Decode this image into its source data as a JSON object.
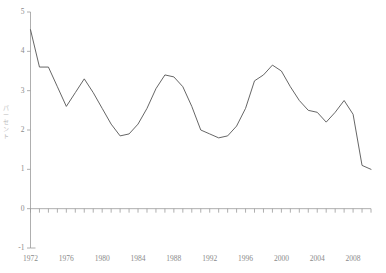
{
  "figure": {
    "top_note": "",
    "background": "#ffffff",
    "line_color": "#555555",
    "axis_color": "#9a9a9a",
    "label_color": "#8a8a8a"
  },
  "axis_labels": {
    "y_vertical_chars": [
      "パ",
      "ー",
      "セ",
      "ン",
      "ト"
    ]
  },
  "chart_data": {
    "type": "line",
    "title": "",
    "subtitle": "",
    "xlabel": "",
    "ylabel": "パーセント",
    "xlim": [
      1972,
      2010
    ],
    "ylim": [
      -1,
      5
    ],
    "grid": false,
    "legend": null,
    "x_tick_labels": [
      "1972",
      "1976",
      "1980",
      "1984",
      "1988",
      "1992",
      "1996",
      "2000",
      "2004",
      "2008"
    ],
    "x_tick_values": [
      1972,
      1976,
      1980,
      1984,
      1988,
      1992,
      1996,
      2000,
      2004,
      2008
    ],
    "x_minor_ticks_every": 1,
    "y_tick_labels": [
      "5",
      "4",
      "3",
      "2",
      "1",
      "0",
      "-1"
    ],
    "y_tick_values": [
      5,
      4,
      3,
      2,
      1,
      0,
      -1
    ],
    "x": [
      1972,
      1973,
      1974,
      1975,
      1976,
      1977,
      1978,
      1979,
      1980,
      1981,
      1982,
      1983,
      1984,
      1985,
      1986,
      1987,
      1988,
      1989,
      1990,
      1991,
      1992,
      1993,
      1994,
      1995,
      1996,
      1997,
      1998,
      1999,
      2000,
      2001,
      2002,
      2003,
      2004,
      2005,
      2006,
      2007,
      2008,
      2009,
      2010
    ],
    "series": [
      {
        "name": "パーセント",
        "color": "#555555",
        "values": [
          4.55,
          3.6,
          3.6,
          3.1,
          2.6,
          2.95,
          3.3,
          2.95,
          2.55,
          2.15,
          1.85,
          1.9,
          2.15,
          2.55,
          3.05,
          3.4,
          3.35,
          3.1,
          2.6,
          2.0,
          1.9,
          1.8,
          1.85,
          2.1,
          2.55,
          3.25,
          3.4,
          3.65,
          3.5,
          3.1,
          2.75,
          2.5,
          2.45,
          2.2,
          2.45,
          2.75,
          2.4,
          1.1,
          1.0
        ]
      }
    ],
    "annotations": [
      {
        "label": "start",
        "x": 1972,
        "y": 4.55
      },
      {
        "label": "plateau",
        "x": 1973,
        "y": 3.6
      },
      {
        "label": "trough",
        "x": 1976,
        "y": 2.6
      },
      {
        "label": "peak",
        "x": 1978,
        "y": 3.3
      },
      {
        "label": "trough",
        "x": 1982,
        "y": 1.85
      },
      {
        "label": "peak",
        "x": 1987,
        "y": 3.4
      },
      {
        "label": "trough",
        "x": 1993,
        "y": 1.8
      },
      {
        "label": "peak",
        "x": 1999,
        "y": 3.65
      },
      {
        "label": "dip",
        "x": 2005,
        "y": 2.2
      },
      {
        "label": "peak",
        "x": 2007,
        "y": 2.75
      },
      {
        "label": "drop",
        "x": 2009,
        "y": 1.1
      },
      {
        "label": "end",
        "x": 2010,
        "y": 0.0
      }
    ]
  }
}
